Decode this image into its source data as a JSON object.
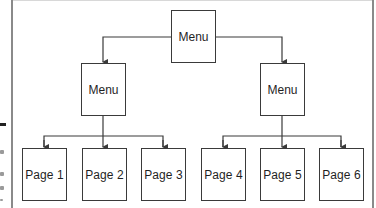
{
  "diagram": {
    "type": "hierarchy",
    "colors": {
      "line": "#3a3a3a",
      "text": "#1f1f1f",
      "frame": "#8a8a8a",
      "background": "#ffffff"
    },
    "nodes": {
      "root": {
        "label": "Menu"
      },
      "left_menu": {
        "label": "Menu"
      },
      "right_menu": {
        "label": "Menu"
      },
      "pages": [
        {
          "label": "Page 1",
          "parent": "left_menu"
        },
        {
          "label": "Page 2",
          "parent": "left_menu"
        },
        {
          "label": "Page 3",
          "parent": "left_menu"
        },
        {
          "label": "Page 4",
          "parent": "right_menu"
        },
        {
          "label": "Page 5",
          "parent": "right_menu"
        },
        {
          "label": "Page 6",
          "parent": "right_menu"
        }
      ]
    },
    "edges": [
      [
        "root",
        "left_menu"
      ],
      [
        "root",
        "right_menu"
      ],
      [
        "left_menu",
        "Page 1"
      ],
      [
        "left_menu",
        "Page 2"
      ],
      [
        "left_menu",
        "Page 3"
      ],
      [
        "right_menu",
        "Page 4"
      ],
      [
        "right_menu",
        "Page 5"
      ],
      [
        "right_menu",
        "Page 6"
      ]
    ]
  }
}
